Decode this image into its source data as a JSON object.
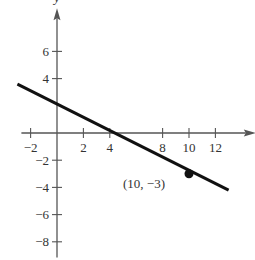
{
  "chart_data": {
    "type": "line",
    "title": "",
    "xlabel": "x",
    "ylabel": "y",
    "xlim": [
      -3,
      14
    ],
    "ylim": [
      -9,
      8
    ],
    "grid": false,
    "x_ticks": [
      -2,
      2,
      4,
      8,
      10,
      12
    ],
    "x_tick_labels": [
      "−2",
      "2",
      "4",
      "8",
      "10",
      "12"
    ],
    "y_ticks": [
      6,
      4,
      -2,
      -4,
      -6,
      -8
    ],
    "y_tick_labels": [
      "6",
      "4",
      "−2",
      "−4",
      "−6",
      "−8"
    ],
    "series": [
      {
        "name": "line",
        "x": [
          -3,
          13
        ],
        "y": [
          3.6,
          -4.2
        ],
        "slope": -0.5,
        "intercept": 2,
        "color": "#111111"
      }
    ],
    "points": [
      {
        "x": 10,
        "y": -3,
        "label": "(10, −3)"
      }
    ],
    "annotations": [
      {
        "text": "(10, −3)",
        "x": 10,
        "y": -3,
        "position": "left-below"
      }
    ]
  }
}
